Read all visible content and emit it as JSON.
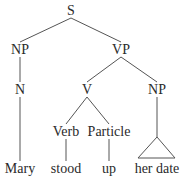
{
  "tree": {
    "root": "S",
    "nodes": [
      {
        "id": "s",
        "label": "S"
      },
      {
        "id": "np1",
        "label": "NP"
      },
      {
        "id": "vp",
        "label": "VP"
      },
      {
        "id": "n",
        "label": "N"
      },
      {
        "id": "v",
        "label": "V"
      },
      {
        "id": "np2",
        "label": "NP"
      },
      {
        "id": "verb",
        "label": "Verb"
      },
      {
        "id": "particle",
        "label": "Particle"
      },
      {
        "id": "mary",
        "label": "Mary"
      },
      {
        "id": "stood",
        "label": "stood"
      },
      {
        "id": "up",
        "label": "up"
      },
      {
        "id": "herdate",
        "label": "her date"
      }
    ],
    "edges": [
      [
        "s",
        "np1"
      ],
      [
        "s",
        "vp"
      ],
      [
        "np1",
        "n"
      ],
      [
        "n",
        "mary"
      ],
      [
        "vp",
        "v"
      ],
      [
        "vp",
        "np2"
      ],
      [
        "v",
        "verb"
      ],
      [
        "v",
        "particle"
      ],
      [
        "verb",
        "stood"
      ],
      [
        "particle",
        "up"
      ]
    ],
    "triangle": {
      "parent": "np2",
      "leaf": "herdate"
    }
  }
}
